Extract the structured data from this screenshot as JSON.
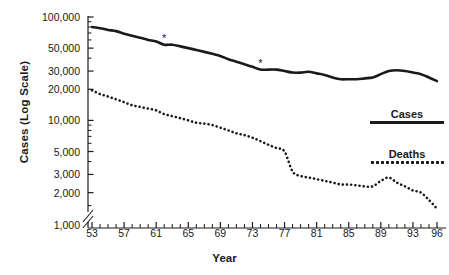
{
  "chart_data": {
    "type": "line",
    "title": "",
    "xlabel": "Year",
    "ylabel": "Cases (Log Scale)",
    "yscale": "log",
    "ylim": [
      1000,
      100000
    ],
    "xlim": [
      53,
      96
    ],
    "grid": false,
    "axis_break": true,
    "axis_break_note": "y-axis break between 1,000 and lowest plotted value",
    "legend_position": "right-middle",
    "ytick_labels": [
      "100,000",
      "50,000",
      "30,000",
      "20,000",
      "10,000",
      "5,000",
      "3,000",
      "2,000",
      "1,000"
    ],
    "ytick_values": [
      100000,
      50000,
      30000,
      20000,
      10000,
      5000,
      3000,
      2000,
      1000
    ],
    "xtick_labels": [
      "53",
      "57",
      "61",
      "65",
      "69",
      "73",
      "77",
      "81",
      "85",
      "89",
      "93",
      "96"
    ],
    "xtick_values": [
      53,
      57,
      61,
      65,
      69,
      73,
      77,
      81,
      85,
      89,
      93,
      96
    ],
    "x": [
      53,
      54,
      55,
      56,
      57,
      58,
      59,
      60,
      61,
      62,
      63,
      64,
      65,
      66,
      67,
      68,
      69,
      70,
      71,
      72,
      73,
      74,
      75,
      76,
      77,
      78,
      79,
      80,
      81,
      82,
      83,
      84,
      85,
      86,
      87,
      88,
      89,
      90,
      91,
      92,
      93,
      94,
      95,
      96
    ],
    "series": [
      {
        "name": "Cases",
        "style": "solid",
        "color": "#1a1a1a",
        "values": [
          80000,
          78000,
          75000,
          73000,
          69000,
          66000,
          63000,
          60000,
          58000,
          54000,
          54000,
          52000,
          50000,
          48000,
          46000,
          44000,
          42000,
          39000,
          37000,
          35000,
          33000,
          31000,
          31000,
          31000,
          30000,
          29000,
          29000,
          29500,
          28500,
          27500,
          26000,
          25000,
          25000,
          25000,
          25500,
          26000,
          28000,
          30000,
          30500,
          30000,
          29000,
          28000,
          26000,
          24000
        ]
      },
      {
        "name": "Deaths",
        "style": "dotted",
        "color": "#1a1a1a",
        "values": [
          19500,
          18000,
          17000,
          16000,
          15000,
          14000,
          13500,
          13000,
          12500,
          11500,
          11000,
          10500,
          10000,
          9500,
          9300,
          9000,
          8500,
          8000,
          7500,
          7200,
          6800,
          6300,
          5800,
          5400,
          5000,
          3200,
          2900,
          2800,
          2700,
          2600,
          2500,
          2400,
          2400,
          2350,
          2300,
          2300,
          2600,
          2800,
          2500,
          2300,
          2100,
          2000,
          1700,
          1400
        ]
      }
    ],
    "annotations": [
      {
        "symbol": "*",
        "x": 62,
        "series": "Cases"
      },
      {
        "symbol": "*",
        "x": 74,
        "series": "Cases"
      }
    ]
  },
  "legend": {
    "cases_label": "Cases",
    "deaths_label": "Deaths"
  }
}
